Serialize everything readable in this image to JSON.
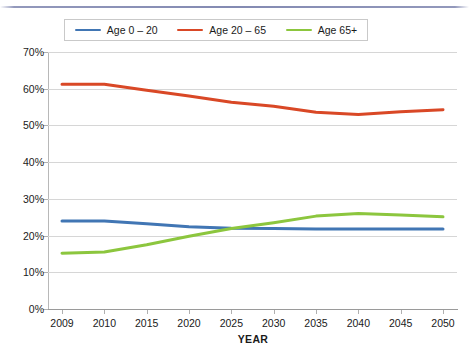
{
  "chart_data": {
    "type": "line",
    "title": "",
    "xlabel": "YEAR",
    "ylabel": "",
    "categories": [
      "2009",
      "2010",
      "2015",
      "2020",
      "2025",
      "2030",
      "2035",
      "2040",
      "2045",
      "2050"
    ],
    "ylim": [
      0,
      70
    ],
    "ytick_labels": [
      "0%",
      "10%",
      "20%",
      "30%",
      "40%",
      "50%",
      "60%",
      "70%"
    ],
    "ytick_values": [
      0,
      10,
      20,
      30,
      40,
      50,
      60,
      70
    ],
    "grid": "horizontal",
    "legend_position": "top",
    "series": [
      {
        "name": "Age 0 – 20",
        "color": "#4176b4",
        "values": [
          24.0,
          24.0,
          23.2,
          22.4,
          22.0,
          21.9,
          21.8,
          21.8,
          21.8,
          21.8
        ]
      },
      {
        "name": "Age 20 – 65",
        "color": "#d94826",
        "values": [
          61.2,
          61.2,
          59.6,
          58.0,
          56.3,
          55.2,
          53.6,
          53.0,
          53.7,
          54.3
        ]
      },
      {
        "name": "Age 65+",
        "color": "#8cc63e",
        "values": [
          15.2,
          15.5,
          17.5,
          19.8,
          21.9,
          23.5,
          25.3,
          26.0,
          25.6,
          25.1
        ]
      }
    ]
  },
  "legend": {
    "items": [
      {
        "label": "Age 0 – 20",
        "color": "#4176b4"
      },
      {
        "label": "Age 20 – 65",
        "color": "#d94826"
      },
      {
        "label": "Age 65+",
        "color": "#8cc63e"
      }
    ]
  },
  "axes": {
    "x_title": "YEAR"
  }
}
